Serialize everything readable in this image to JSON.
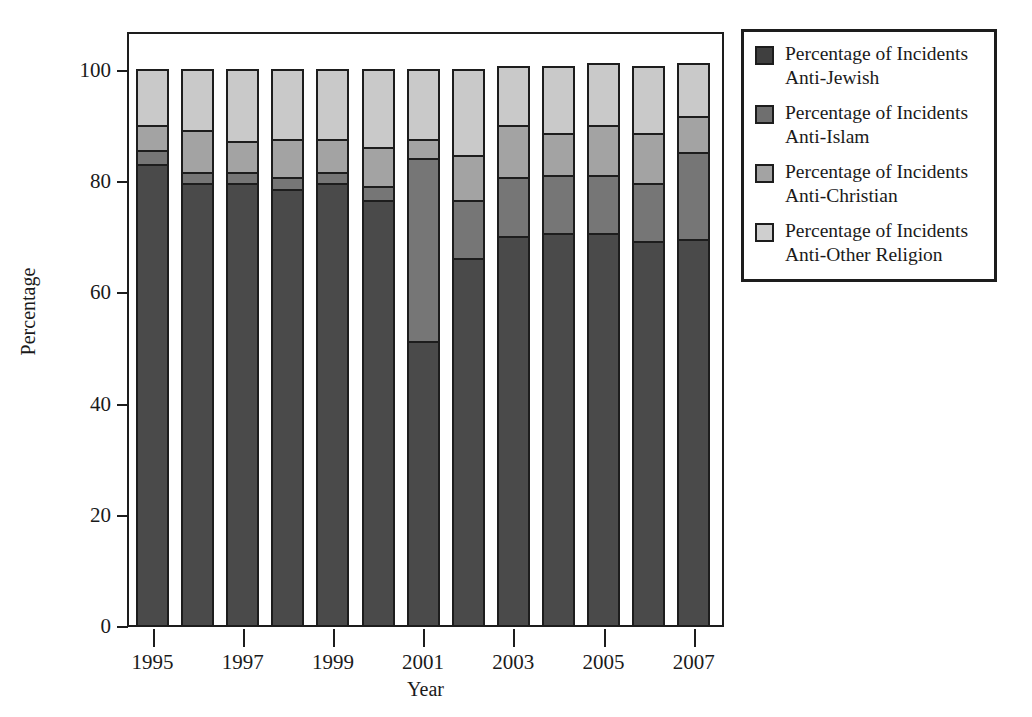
{
  "chart_data": {
    "type": "bar",
    "subtype": "stacked-bar-100",
    "title": "",
    "xlabel": "Year",
    "ylabel": "Percentage",
    "ylim": [
      0,
      100
    ],
    "yticks": [
      0,
      20,
      40,
      60,
      80,
      100
    ],
    "xticks": [
      1995,
      1997,
      1999,
      2001,
      2003,
      2005,
      2007
    ],
    "xtick_labels": [
      "1995",
      "1997",
      "1999",
      "2001",
      "2003",
      "2005",
      "2007"
    ],
    "grid": false,
    "legend_position": "upper right",
    "categories": [
      "1995",
      "1996",
      "1997",
      "1998",
      "1999",
      "2000",
      "2001",
      "2002",
      "2003",
      "2004",
      "2005",
      "2006",
      "2007"
    ],
    "series": [
      {
        "name": "Percentage of Incidents\nAnti-Jewish",
        "short_name": "Anti-Jewish",
        "color": "#4a4a4a",
        "values": [
          83,
          79.5,
          79.5,
          78.5,
          79.5,
          76.5,
          51,
          66,
          70,
          70.5,
          70.5,
          69,
          69.5
        ]
      },
      {
        "name": "Percentage of Incidents\nAnti-Islam",
        "short_name": "Anti-Islam",
        "color": "#767676",
        "values": [
          2.5,
          2,
          2,
          2,
          2,
          2.5,
          33,
          10.5,
          10.5,
          10.5,
          10.5,
          10.5,
          15.5
        ]
      },
      {
        "name": "Percentage of Incidents\nAnti-Christian",
        "short_name": "Anti-Christian",
        "color": "#a3a3a3",
        "values": [
          4.5,
          7.5,
          5.5,
          7,
          6,
          7,
          3.5,
          8,
          9.5,
          7.5,
          9,
          9,
          6.5
        ]
      },
      {
        "name": "Percentage of Incidents\nAnti-Other Religion",
        "short_name": "Anti-Other Religion",
        "color": "#c9c9c9",
        "values": [
          10,
          11,
          13,
          12.5,
          12.5,
          14,
          12.5,
          15.5,
          10.5,
          12,
          11,
          12,
          9.5
        ]
      }
    ]
  },
  "legend": {
    "items": [
      {
        "label": "Percentage of Incidents\nAnti-Jewish",
        "color": "#3f3f3f"
      },
      {
        "label": "Percentage of Incidents\nAnti-Islam",
        "color": "#6f6f6f"
      },
      {
        "label": "Percentage of Incidents\nAnti-Christian",
        "color": "#a3a3a3"
      },
      {
        "label": "Percentage of Incidents\nAnti-Other Religion",
        "color": "#cfcfcf"
      }
    ]
  },
  "axes": {
    "y_title": "Percentage",
    "x_title": "Year"
  }
}
